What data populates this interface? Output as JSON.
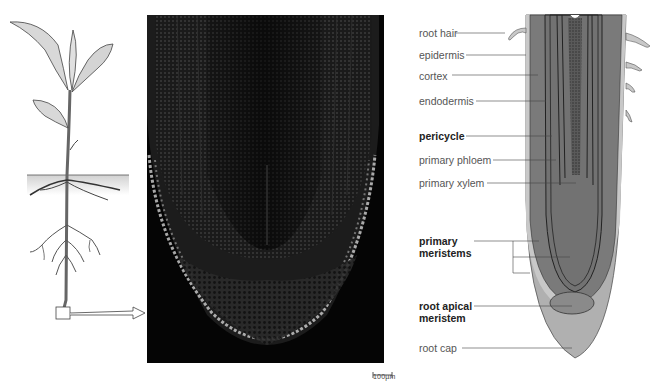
{
  "figure": {
    "panels": {
      "plant_illustration": {
        "name": "whole plant with root system",
        "highlight_box": "root tip region"
      },
      "micrograph": {
        "name": "root tip longitudinal section micrograph",
        "scale_bar": "100µm"
      },
      "diagram": {
        "name": "labeled root tip diagram"
      }
    },
    "labels": [
      {
        "text": "root hair",
        "bold": false
      },
      {
        "text": "epidermis",
        "bold": false
      },
      {
        "text": "cortex",
        "bold": false
      },
      {
        "text": "endodermis",
        "bold": false
      },
      {
        "text": "pericycle",
        "bold": true
      },
      {
        "text": "primary phloem",
        "bold": false
      },
      {
        "text": "primary xylem",
        "bold": false
      },
      {
        "text": "primary\nmeristems",
        "bold": true,
        "line1": "primary",
        "line2": "meristems"
      },
      {
        "text": "root apical\nmeristem",
        "bold": true,
        "line1": "root apical",
        "line2": "meristem"
      },
      {
        "text": "root cap",
        "bold": false
      }
    ],
    "colors": {
      "cortex_gray": "#7a7a7a",
      "stele_gray": "#6f6f6f",
      "epidermis_light": "#c8c8c8",
      "root_cap": "#b0b0b0",
      "apical_meristem": "#8a8a8a",
      "micrograph_bg": "#050505",
      "label_text": "#555555",
      "bold_label_text": "#222222",
      "leader_line": "#444444"
    }
  }
}
